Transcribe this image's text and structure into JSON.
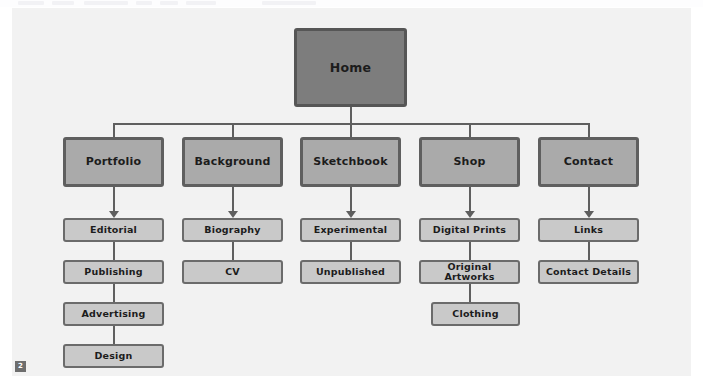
{
  "canvas": {
    "background_color": "#f2f2f2",
    "badge_label": "2"
  },
  "colors": {
    "level1_fill": "#7d7d7d",
    "level2_fill": "#aaaaaa",
    "level3_fill": "#c9c9c9",
    "stroke": "#5f5f5f",
    "text": "#1c1c1c"
  },
  "sitemap": {
    "root": {
      "label": "Home"
    },
    "sections": [
      {
        "label": "Portfolio",
        "children": [
          {
            "label": "Editorial"
          },
          {
            "label": "Publishing"
          },
          {
            "label": "Advertising"
          },
          {
            "label": "Design"
          }
        ]
      },
      {
        "label": "Background",
        "children": [
          {
            "label": "Biography"
          },
          {
            "label": "CV"
          }
        ]
      },
      {
        "label": "Sketchbook",
        "children": [
          {
            "label": "Experimental"
          },
          {
            "label": "Unpublished"
          }
        ]
      },
      {
        "label": "Shop",
        "children": [
          {
            "label": "Digital Prints"
          },
          {
            "label": "Original Artworks"
          },
          {
            "label": "Clothing"
          }
        ]
      },
      {
        "label": "Contact",
        "children": [
          {
            "label": "Links"
          },
          {
            "label": "Contact Details"
          }
        ]
      }
    ]
  }
}
